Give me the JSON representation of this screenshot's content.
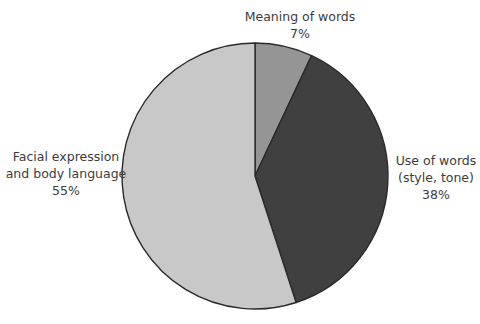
{
  "chart_data": {
    "type": "pie",
    "title": "",
    "start_angle_deg": 0,
    "direction": "clockwise",
    "slices": [
      {
        "label": "Meaning of words",
        "label_lines": [
          "Meaning of words"
        ],
        "value": 7,
        "value_label": "7%",
        "color": "#959595"
      },
      {
        "label": "Use of words (style, tone)",
        "label_lines": [
          "Use of words",
          "(style, tone)"
        ],
        "value": 38,
        "value_label": "38%",
        "color": "#404040"
      },
      {
        "label": "Facial expression and body language",
        "label_lines": [
          "Facial expression",
          "and body language"
        ],
        "value": 55,
        "value_label": "55%",
        "color": "#c8c8c8"
      }
    ],
    "outline_color": "#2a2a2a",
    "legend": "none (direct labels)"
  }
}
